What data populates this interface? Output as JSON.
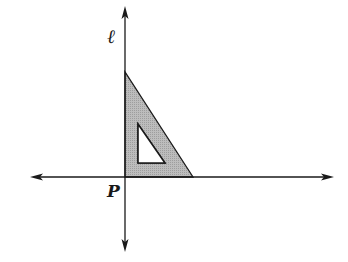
{
  "diagram": {
    "labels": {
      "line": "ℓ",
      "point": "P"
    },
    "colors": {
      "stroke": "#1a1a1a",
      "fill": "#b8b8b8",
      "hole": "#ffffff",
      "background": "#ffffff"
    },
    "axes": {
      "vertical_line": {
        "x": 125,
        "y_top": 6,
        "y_bottom": 252
      },
      "horizontal_line": {
        "y": 177,
        "x_left": 30,
        "x_right": 334
      }
    },
    "outer_triangle": [
      [
        125,
        72
      ],
      [
        125,
        177
      ],
      [
        193,
        177
      ]
    ],
    "inner_triangle": [
      [
        138,
        124
      ],
      [
        138,
        163
      ],
      [
        165,
        163
      ]
    ]
  }
}
